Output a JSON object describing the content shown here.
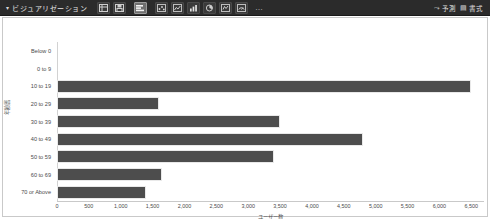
{
  "toolbar": {
    "caret": "▾",
    "title": "ビジュアリゼーション",
    "overflow_label": "…",
    "buttons": [
      {
        "name": "table-view-button",
        "icon": "table-icon",
        "active": false
      },
      {
        "name": "save-button",
        "icon": "save-icon",
        "active": false
      },
      {
        "name": "bar-chart-button",
        "icon": "bar-chart-icon",
        "active": true
      },
      {
        "name": "scatter-chart-button",
        "icon": "scatter-icon",
        "active": false
      },
      {
        "name": "line-chart-button",
        "icon": "line-chart-icon",
        "active": false
      },
      {
        "name": "column-chart-button",
        "icon": "column-chart-icon",
        "active": false
      },
      {
        "name": "pie-chart-button",
        "icon": "pie-chart-icon",
        "active": false
      },
      {
        "name": "map-chart-button",
        "icon": "map-icon",
        "active": false
      },
      {
        "name": "gauge-chart-button",
        "icon": "gauge-icon",
        "active": false
      }
    ],
    "right_items": [
      {
        "name": "forecast-button",
        "glyph": "⤳",
        "label": "予測"
      },
      {
        "name": "format-button",
        "glyph": "▤",
        "label": "書式"
      }
    ]
  },
  "chart_data": {
    "type": "bar",
    "orientation": "horizontal",
    "title": "",
    "xlabel": "ユーザー数",
    "ylabel": "年齢層",
    "categories": [
      "Below 0",
      "0 to 9",
      "10 to 19",
      "20 to 29",
      "30 to 39",
      "40 to 49",
      "50 to 59",
      "60 to 69",
      "70 or Above"
    ],
    "values": [
      0,
      0,
      6500,
      1600,
      3500,
      4800,
      3400,
      1650,
      1400
    ],
    "xlim": [
      0,
      6700
    ],
    "xticks": [
      0,
      500,
      1000,
      1500,
      2000,
      2500,
      3000,
      3500,
      4000,
      4500,
      5000,
      5500,
      6000,
      6500
    ],
    "xticklabels": [
      "0",
      "500",
      "1,000",
      "1,500",
      "2,000",
      "2,500",
      "3,000",
      "3,500",
      "4,000",
      "4,500",
      "5,000",
      "5,500",
      "6,000",
      "6,500"
    ],
    "grid": false,
    "legend": false,
    "bar_color": "#4d4d4d"
  }
}
